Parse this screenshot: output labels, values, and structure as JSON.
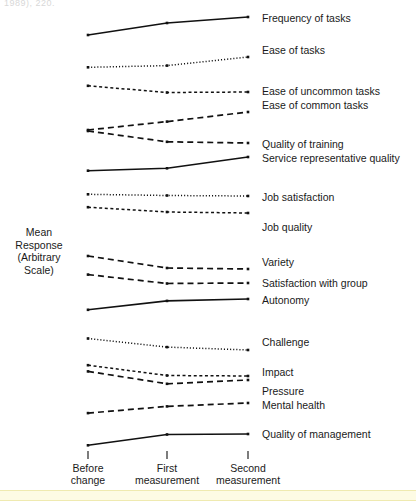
{
  "figure": {
    "top_fragment": "1989), 220.",
    "ylabel_lines": [
      "Mean",
      "Response",
      "(Arbitrary",
      "Scale)"
    ],
    "ink_color": "#111111",
    "background": "#ffffff",
    "band_color": "#fdfbe4"
  },
  "chart_data": {
    "type": "line",
    "title": "",
    "subtitle": "",
    "xlabel": "",
    "ylabel": "Mean Response (Arbitrary Scale)",
    "grid": false,
    "legend": "right-inline-labels",
    "x": [
      "Before change",
      "First measurement",
      "Second measurement"
    ],
    "x_tick_labels": [
      [
        "Before",
        "change"
      ],
      [
        "First",
        "measurement"
      ],
      [
        "Second",
        "measurement"
      ]
    ],
    "ylim": [
      0,
      100
    ],
    "yaxis_note": "Arbitrary scale; series are vertically offset for readability and have no common numeric origin.",
    "series": [
      {
        "name": "Frequency of tasks",
        "style": "solid",
        "values": [
          88.0,
          93.0,
          95.5
        ]
      },
      {
        "name": "Ease of tasks",
        "style": "dotted",
        "values": [
          80.5,
          81.2,
          84.8
        ]
      },
      {
        "name": "Ease of uncommon tasks",
        "style": "fine-dashed",
        "values": [
          72.8,
          70.0,
          70.2
        ]
      },
      {
        "name": "Ease of common tasks",
        "style": "dashed",
        "values": [
          64.0,
          67.5,
          71.5
        ]
      },
      {
        "name": "Quality of training",
        "style": "dashed",
        "values": [
          62.0,
          57.5,
          57.0
        ]
      },
      {
        "name": "Service representative quality",
        "style": "solid",
        "values": [
          48.8,
          49.8,
          54.5
        ]
      },
      {
        "name": "Job satisfaction",
        "style": "dotted",
        "values": [
          42.5,
          42.0,
          41.8
        ]
      },
      {
        "name": "Job quality",
        "style": "fine-dashed",
        "values": [
          36.0,
          34.0,
          33.6
        ]
      },
      {
        "name": "Variety",
        "style": "dashed",
        "values": [
          31.0,
          26.0,
          25.6
        ]
      },
      {
        "name": "Satisfaction with group",
        "style": "dashed",
        "values": [
          24.5,
          20.8,
          21.0
        ]
      },
      {
        "name": "Autonomy",
        "style": "solid",
        "values": [
          13.5,
          17.2,
          18.0
        ]
      },
      {
        "name": "Challenge",
        "style": "dotted",
        "values": [
          12.0,
          8.4,
          7.2
        ]
      },
      {
        "name": "Impact",
        "style": "fine-dashed",
        "values": [
          6.5,
          2.2,
          2.0
        ]
      },
      {
        "name": "Pressure",
        "style": "dashed",
        "values": [
          2.2,
          -3.0,
          -1.4
        ]
      },
      {
        "name": "Mental health",
        "style": "dashed",
        "values": [
          -7.0,
          -4.2,
          -2.8
        ]
      },
      {
        "name": "Quality of management",
        "style": "solid",
        "values": [
          -14.0,
          -9.5,
          -9.3
        ]
      }
    ]
  },
  "series_labels": [
    {
      "text": "Frequency of tasks",
      "x": 262,
      "y": 13
    },
    {
      "text": "Ease of tasks",
      "x": 262,
      "y": 45
    },
    {
      "text": "Ease of uncommon tasks",
      "x": 262,
      "y": 86
    },
    {
      "text": "Ease of common tasks",
      "x": 262,
      "y": 100
    },
    {
      "text": "Quality of training",
      "x": 262,
      "y": 139
    },
    {
      "text": "Service representative quality",
      "x": 262,
      "y": 153
    },
    {
      "text": "Job satisfaction",
      "x": 262,
      "y": 192
    },
    {
      "text": "Job quality",
      "x": 262,
      "y": 222
    },
    {
      "text": "Variety",
      "x": 262,
      "y": 257
    },
    {
      "text": "Satisfaction with group",
      "x": 262,
      "y": 278
    },
    {
      "text": "Autonomy",
      "x": 262,
      "y": 295
    },
    {
      "text": "Challenge",
      "x": 262,
      "y": 337
    },
    {
      "text": "Impact",
      "x": 262,
      "y": 367
    },
    {
      "text": "Pressure",
      "x": 262,
      "y": 386
    },
    {
      "text": "Mental health",
      "x": 262,
      "y": 400
    },
    {
      "text": "Quality of management",
      "x": 262,
      "y": 429
    }
  ],
  "xticks": [
    {
      "line1": "Before",
      "line2": "change",
      "cx": 88
    },
    {
      "line1": "First",
      "line2": "measurement",
      "cx": 167
    },
    {
      "line1": "Second",
      "line2": "measurement",
      "cx": 248
    }
  ]
}
